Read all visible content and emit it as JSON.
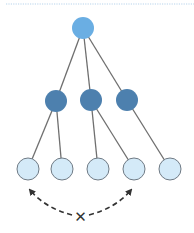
{
  "diagram": {
    "colors": {
      "root": "#6aaee3",
      "middle": "#4d80ae",
      "leaf_fill": "#d4eaf8",
      "leaf_stroke": "#6f7a84",
      "edge": "#6f6f6f",
      "arrow": "#333333",
      "top_rule": "#b7d3ec"
    },
    "nodes": [
      {
        "id": "root",
        "level": 0,
        "x": 83,
        "y": 28,
        "r": 11
      },
      {
        "id": "m1",
        "level": 1,
        "x": 56,
        "y": 101,
        "r": 11
      },
      {
        "id": "m2",
        "level": 1,
        "x": 91,
        "y": 100,
        "r": 11
      },
      {
        "id": "m3",
        "level": 1,
        "x": 127,
        "y": 100,
        "r": 11
      },
      {
        "id": "l1",
        "level": 2,
        "x": 28,
        "y": 169,
        "r": 11
      },
      {
        "id": "l2",
        "level": 2,
        "x": 62,
        "y": 169,
        "r": 11
      },
      {
        "id": "l3",
        "level": 2,
        "x": 98,
        "y": 169,
        "r": 11
      },
      {
        "id": "l4",
        "level": 2,
        "x": 134,
        "y": 169,
        "r": 11
      },
      {
        "id": "l5",
        "level": 2,
        "x": 170,
        "y": 169,
        "r": 11
      }
    ],
    "edges": [
      [
        "root",
        "m1"
      ],
      [
        "root",
        "m2"
      ],
      [
        "root",
        "m3"
      ],
      [
        "m1",
        "l1"
      ],
      [
        "m1",
        "l2"
      ],
      [
        "m2",
        "l3"
      ],
      [
        "m2",
        "l4"
      ],
      [
        "m3",
        "l5"
      ]
    ],
    "blocked_link": {
      "from": "l1",
      "to": "l4",
      "marker": "✕",
      "marker_label": "no direct connection"
    }
  }
}
